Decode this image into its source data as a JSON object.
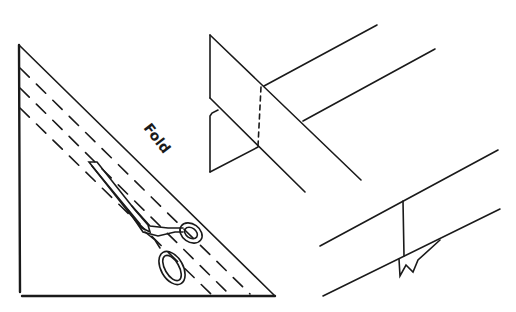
{
  "diagram": {
    "type": "instructional line drawing",
    "panels": [
      {
        "name": "folded-triangle-cutting",
        "description": "Folded fabric triangle with dashed cutting lines parallel to fold, scissors cutting along strips"
      },
      {
        "name": "strip-joining",
        "description": "Two bias strips overlapped at right angle, dashed seam line"
      },
      {
        "name": "joined-strip",
        "description": "Joined strip with seam and trimmed corners"
      }
    ],
    "labels": {
      "fold": "Fold"
    },
    "colors": {
      "ink": "#1a1a1a",
      "background": "#ffffff"
    }
  }
}
